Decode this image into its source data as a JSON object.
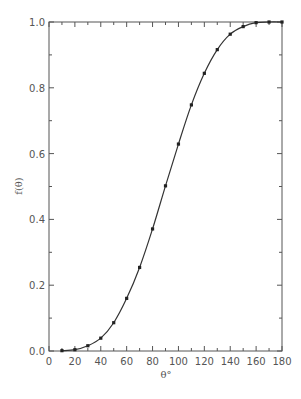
{
  "chart_data": {
    "type": "line",
    "title": "",
    "xlabel": "θ°",
    "ylabel": "f(θ)",
    "xlim": [
      0,
      180
    ],
    "ylim": [
      0.0,
      1.0
    ],
    "x_ticks_major": [
      0,
      20,
      40,
      60,
      80,
      100,
      120,
      140,
      160,
      180
    ],
    "x_tick_labels": [
      "0",
      "20",
      "40",
      "60",
      "80",
      "100",
      "120",
      "140",
      "160",
      "180"
    ],
    "x_ticks_minor_step": 10,
    "y_ticks_major": [
      0.0,
      0.2,
      0.4,
      0.6,
      0.8,
      1.0
    ],
    "y_tick_labels": [
      "0.0",
      "0.2",
      "0.4",
      "0.6",
      "0.8",
      "1.0"
    ],
    "y_ticks_minor_step": 0.1,
    "grid": false,
    "legend": null,
    "series": [
      {
        "name": "data points",
        "style": "markers",
        "x": [
          10,
          20,
          30,
          40,
          50,
          60,
          70,
          80,
          90,
          100,
          110,
          120,
          130,
          140,
          150,
          160,
          170,
          180
        ],
        "values": [
          0.001,
          0.004,
          0.016,
          0.039,
          0.086,
          0.16,
          0.254,
          0.371,
          0.502,
          0.629,
          0.748,
          0.844,
          0.916,
          0.963,
          0.986,
          0.998,
          1.0,
          1.0
        ]
      },
      {
        "name": "fitted curve",
        "style": "line",
        "x": [
          10,
          20,
          30,
          40,
          50,
          60,
          70,
          80,
          90,
          100,
          110,
          120,
          130,
          140,
          150,
          160,
          170,
          180
        ],
        "values": [
          0.001,
          0.004,
          0.016,
          0.039,
          0.086,
          0.16,
          0.254,
          0.371,
          0.502,
          0.629,
          0.748,
          0.844,
          0.916,
          0.963,
          0.986,
          0.998,
          1.0,
          1.0
        ]
      }
    ]
  },
  "colors": {
    "axis": "#555555",
    "curve": "#333333",
    "marker": "#222222"
  }
}
